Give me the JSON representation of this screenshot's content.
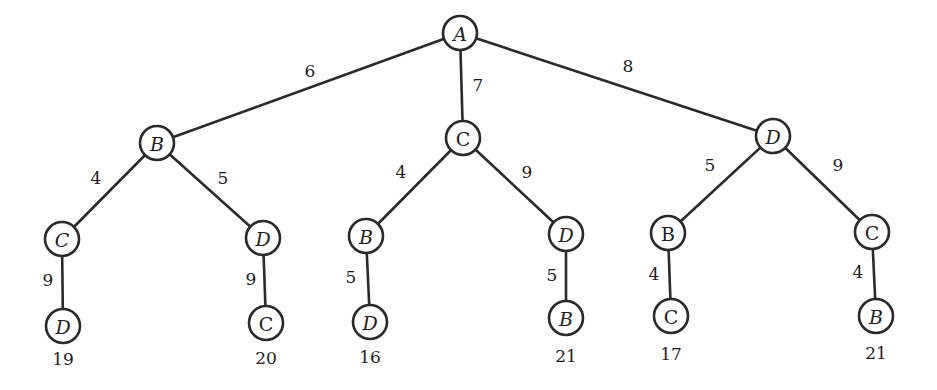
{
  "diagram": {
    "type": "weighted-tree",
    "colors": {
      "stroke": "#2a2a2a",
      "text": "#1e1e1e",
      "node_fill": "#ffffff",
      "background": "#fefefe"
    },
    "node_radius": 17,
    "nodes": [
      {
        "id": "root",
        "label": "A",
        "x": 460,
        "y": 33,
        "italic": true
      },
      {
        "id": "l1-b",
        "label": "B",
        "x": 157,
        "y": 143,
        "italic": true
      },
      {
        "id": "l1-c",
        "label": "C",
        "x": 463,
        "y": 138,
        "italic": false
      },
      {
        "id": "l1-d",
        "label": "D",
        "x": 773,
        "y": 136,
        "italic": true
      },
      {
        "id": "l2-bc",
        "label": "C",
        "x": 62,
        "y": 239,
        "italic": true
      },
      {
        "id": "l2-bd",
        "label": "D",
        "x": 263,
        "y": 238,
        "italic": true
      },
      {
        "id": "l2-cb",
        "label": "B",
        "x": 366,
        "y": 236,
        "italic": true
      },
      {
        "id": "l2-cd",
        "label": "D",
        "x": 566,
        "y": 234,
        "italic": true
      },
      {
        "id": "l2-db",
        "label": "B",
        "x": 668,
        "y": 233,
        "italic": false
      },
      {
        "id": "l2-dc",
        "label": "C",
        "x": 872,
        "y": 232,
        "italic": false
      },
      {
        "id": "l3-bcd",
        "label": "D",
        "x": 63,
        "y": 326,
        "italic": true
      },
      {
        "id": "l3-bdc",
        "label": "C",
        "x": 266,
        "y": 323,
        "italic": false
      },
      {
        "id": "l3-cbd",
        "label": "D",
        "x": 370,
        "y": 322,
        "italic": true
      },
      {
        "id": "l3-cdb",
        "label": "B",
        "x": 566,
        "y": 318,
        "italic": true
      },
      {
        "id": "l3-dbc",
        "label": "C",
        "x": 671,
        "y": 316,
        "italic": false
      },
      {
        "id": "l3-dcb",
        "label": "B",
        "x": 876,
        "y": 316,
        "italic": true
      }
    ],
    "edges": [
      {
        "from": "root",
        "to": "l1-b",
        "weight": "6",
        "lx": 310,
        "ly": 71
      },
      {
        "from": "root",
        "to": "l1-c",
        "weight": "7",
        "lx": 478,
        "ly": 85
      },
      {
        "from": "root",
        "to": "l1-d",
        "weight": "8",
        "lx": 628,
        "ly": 66
      },
      {
        "from": "l1-b",
        "to": "l2-bc",
        "weight": "4",
        "lx": 96,
        "ly": 178
      },
      {
        "from": "l1-b",
        "to": "l2-bd",
        "weight": "5",
        "lx": 223,
        "ly": 178
      },
      {
        "from": "l1-c",
        "to": "l2-cb",
        "weight": "4",
        "lx": 401,
        "ly": 172
      },
      {
        "from": "l1-c",
        "to": "l2-cd",
        "weight": "9",
        "lx": 527,
        "ly": 172
      },
      {
        "from": "l1-d",
        "to": "l2-db",
        "weight": "5",
        "lx": 710,
        "ly": 165
      },
      {
        "from": "l1-d",
        "to": "l2-dc",
        "weight": "9",
        "lx": 838,
        "ly": 165
      },
      {
        "from": "l2-bc",
        "to": "l3-bcd",
        "weight": "9",
        "lx": 48,
        "ly": 280
      },
      {
        "from": "l2-bd",
        "to": "l3-bdc",
        "weight": "9",
        "lx": 251,
        "ly": 279
      },
      {
        "from": "l2-cb",
        "to": "l3-cbd",
        "weight": "5",
        "lx": 351,
        "ly": 277
      },
      {
        "from": "l2-cd",
        "to": "l3-cdb",
        "weight": "5",
        "lx": 552,
        "ly": 275
      },
      {
        "from": "l2-db",
        "to": "l3-dbc",
        "weight": "4",
        "lx": 654,
        "ly": 274
      },
      {
        "from": "l2-dc",
        "to": "l3-dcb",
        "weight": "4",
        "lx": 858,
        "ly": 272
      }
    ],
    "path_totals": [
      {
        "leaf": "l3-bcd",
        "value": "19",
        "x": 63,
        "y": 359
      },
      {
        "leaf": "l3-bdc",
        "value": "20",
        "x": 266,
        "y": 358
      },
      {
        "leaf": "l3-cbd",
        "value": "16",
        "x": 370,
        "y": 357
      },
      {
        "leaf": "l3-cdb",
        "value": "21",
        "x": 566,
        "y": 356
      },
      {
        "leaf": "l3-dbc",
        "value": "17",
        "x": 671,
        "y": 354
      },
      {
        "leaf": "l3-dcb",
        "value": "21",
        "x": 876,
        "y": 353
      }
    ]
  }
}
